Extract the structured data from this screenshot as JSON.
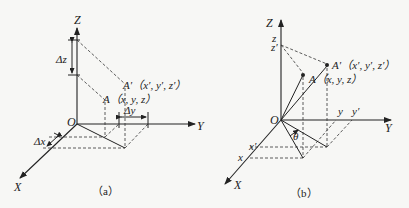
{
  "panel_a": {
    "caption": "（a）",
    "axis_z": "Z",
    "axis_y": "Y",
    "axis_x": "X",
    "origin": "O",
    "delta_z": "Δz",
    "delta_y": "Δy",
    "delta_x": "Δx",
    "point_a": "A（x, y, z）",
    "point_a_prime": "A′（x′, y′, z′）"
  },
  "panel_b": {
    "caption": "（b）",
    "axis_z": "Z",
    "axis_y": "Y",
    "axis_x": "X",
    "origin": "O",
    "tick_z": "z",
    "tick_z_prime": "z′",
    "tick_y": "y",
    "tick_y_prime": "y′",
    "tick_x": "x",
    "tick_x_prime": "x′",
    "angle": "θ",
    "point_a": "A（x, y, z）",
    "point_a_prime": "A′（x′, y′, z′）"
  }
}
